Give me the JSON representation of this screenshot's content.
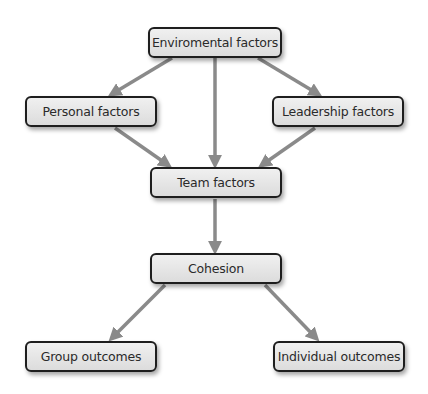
{
  "diagram": {
    "type": "flowchart",
    "colors": {
      "node_border": "#1e1e1e",
      "node_fill": "#e4e4e4",
      "arrow": "#8a8a8a",
      "text": "#2a2a2a"
    },
    "nodes": {
      "environmental": {
        "label": "Enviromental factors"
      },
      "personal": {
        "label": "Personal factors"
      },
      "leadership": {
        "label": "Leadership factors"
      },
      "team": {
        "label": "Team factors"
      },
      "cohesion": {
        "label": "Cohesion"
      },
      "group_outcomes": {
        "label": "Group outcomes"
      },
      "individual_outcomes": {
        "label": "Individual outcomes"
      }
    },
    "edges": [
      {
        "from": "Enviromental factors",
        "to": "Personal factors"
      },
      {
        "from": "Enviromental factors",
        "to": "Team factors"
      },
      {
        "from": "Enviromental factors",
        "to": "Leadership factors"
      },
      {
        "from": "Personal factors",
        "to": "Team factors"
      },
      {
        "from": "Leadership factors",
        "to": "Team factors"
      },
      {
        "from": "Team factors",
        "to": "Cohesion"
      },
      {
        "from": "Cohesion",
        "to": "Group outcomes"
      },
      {
        "from": "Cohesion",
        "to": "Individual outcomes"
      }
    ]
  }
}
